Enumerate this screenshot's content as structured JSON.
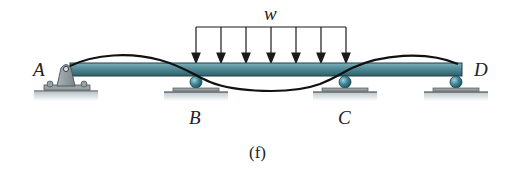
{
  "figure": {
    "caption": "(f)",
    "load": {
      "label": "w",
      "type": "uniformly-distributed-load",
      "arrow_count": 7,
      "x_start": 196,
      "x_end": 346
    },
    "beam": {
      "x_start": 70,
      "x_end": 462,
      "top": 63,
      "bottom": 76,
      "color": "#4f8a96"
    },
    "supports": [
      {
        "id": "A",
        "label": "A",
        "type": "pin",
        "x": 66
      },
      {
        "id": "B",
        "label": "B",
        "type": "roller",
        "x": 196
      },
      {
        "id": "C",
        "label": "C",
        "type": "roller",
        "x": 345
      },
      {
        "id": "D",
        "label": "D",
        "type": "roller",
        "x": 456
      }
    ],
    "deflected_shape": "wavy curve: up between A and B, down between B and C, up between C and D",
    "colors": {
      "beam": "#4f8a96",
      "beam_dark": "#2f5f6a",
      "support": "#8d979b",
      "ball": "#3f8a9a",
      "ground_shadow": "#b8c6cc",
      "line": "#1a1a1a"
    }
  }
}
